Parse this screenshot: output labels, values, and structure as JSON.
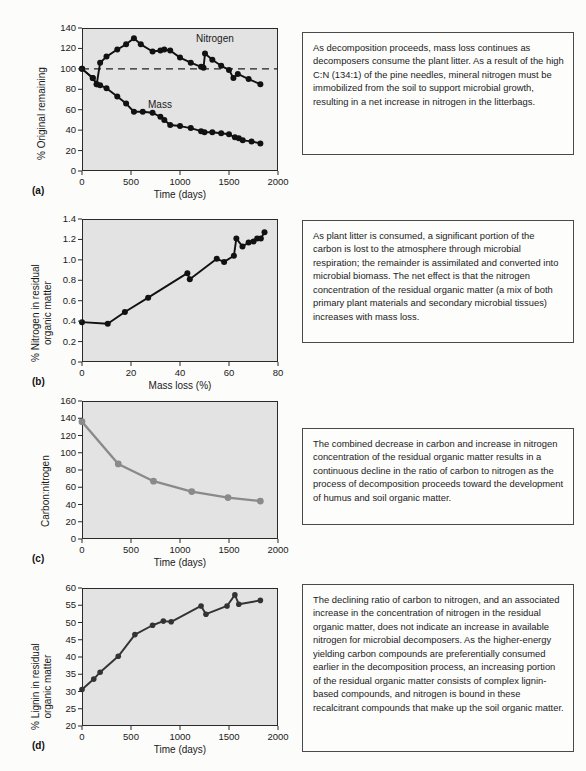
{
  "figure": {
    "panels": [
      "(a)",
      "(b)",
      "(c)",
      "(d)"
    ]
  },
  "panel_a": {
    "letter": "(a)",
    "xlabel": "Time (days)",
    "ylabel": "% Original remaining",
    "series_labels": {
      "nitrogen": "Nitrogen",
      "mass": "Mass"
    },
    "xticks": [
      "0",
      "500",
      "1000",
      "1500",
      "2000"
    ],
    "yticks": [
      "0",
      "20",
      "40",
      "60",
      "80",
      "100",
      "120",
      "140"
    ],
    "text": "As decomposition proceeds, mass loss continues as decomposers consume the plant litter. As a result of the high C:N (134:1) of the pine needles, mineral nitrogen must be immobilized from the soil to support microbial growth, resulting in a net increase in nitrogen in the litterbags."
  },
  "panel_b": {
    "letter": "(b)",
    "xlabel": "Mass loss (%)",
    "ylabel": "% Nitrogen in residual\norganic matter",
    "xticks": [
      "0",
      "20",
      "40",
      "60",
      "80"
    ],
    "yticks": [
      "0",
      "0.2",
      "0.4",
      "0.6",
      "0.8",
      "1.0",
      "1.2",
      "1.4"
    ],
    "text": "As plant litter is consumed, a significant portion of the carbon is lost to the atmosphere through microbial respiration; the remainder is assimilated and converted into microbial biomass. The net effect is that the nitrogen concentration of the residual organic matter (a mix of both primary plant materials and secondary microbial tissues) increases with mass loss."
  },
  "panel_c": {
    "letter": "(c)",
    "xlabel": "Time (days)",
    "ylabel": "Carbon:nitrogen",
    "xticks": [
      "0",
      "500",
      "1000",
      "1500",
      "2000"
    ],
    "yticks": [
      "0",
      "20",
      "40",
      "60",
      "80",
      "100",
      "120",
      "140",
      "160"
    ],
    "text": "The combined decrease in carbon and increase in nitrogen concentration of the residual organic matter results in a continuous decline in the ratio of carbon to nitrogen as the process of decomposition proceeds toward the development of humus and soil organic matter."
  },
  "panel_d": {
    "letter": "(d)",
    "xlabel": "Time (days)",
    "ylabel": "% Lignin in residual\norganic matter",
    "xticks": [
      "0",
      "500",
      "1000",
      "1500",
      "2000"
    ],
    "yticks": [
      "20",
      "25",
      "30",
      "35",
      "40",
      "45",
      "50",
      "55",
      "60"
    ],
    "text": "The declining ratio of carbon to nitrogen, and an associated increase in the concentration of nitrogen in the residual organic matter, does not indicate an increase in available nitrogen for microbial decomposers. As the higher-energy yielding carbon compounds are preferentially consumed earlier in the decomposition process, an increasing portion of the residual organic matter consists of complex lignin-based compounds, and nitrogen is bound in these recalcitrant compounds that make up the soil organic matter."
  },
  "colors": {
    "plot_background": "#e3e3e3",
    "axis": "#2a2a2a",
    "series_dark": "#111111",
    "series_gray": "#8a8a8a",
    "textbox_border": "#4a4a4a",
    "page_background": "#fcfcfa"
  },
  "chart_data": [
    {
      "id": "a",
      "type": "line",
      "title": "",
      "xlabel": "Time (days)",
      "ylabel": "% Original remaining",
      "xlim": [
        0,
        2000
      ],
      "ylim": [
        0,
        140
      ],
      "xticks": [
        0,
        500,
        1000,
        1500,
        2000
      ],
      "yticks": [
        0,
        20,
        40,
        60,
        80,
        100,
        120,
        140
      ],
      "grid": false,
      "legend": "inline-labels",
      "reference_line": {
        "y": 100,
        "style": "dashed",
        "label": "100% original"
      },
      "series": [
        {
          "name": "Nitrogen",
          "color": "#111111",
          "points": [
            [
              0,
              100
            ],
            [
              110,
              91
            ],
            [
              150,
              85
            ],
            [
              185,
              106
            ],
            [
              250,
              112
            ],
            [
              360,
              119
            ],
            [
              450,
              124
            ],
            [
              530,
              130
            ],
            [
              600,
              124
            ],
            [
              720,
              117
            ],
            [
              800,
              118
            ],
            [
              840,
              119
            ],
            [
              900,
              118
            ],
            [
              1000,
              111
            ],
            [
              1110,
              106
            ],
            [
              1215,
              102
            ],
            [
              1240,
              101
            ],
            [
              1255,
              115
            ],
            [
              1330,
              109
            ],
            [
              1420,
              103
            ],
            [
              1500,
              99
            ],
            [
              1545,
              91
            ],
            [
              1590,
              95
            ],
            [
              1700,
              90
            ],
            [
              1820,
              85
            ]
          ]
        },
        {
          "name": "Mass",
          "color": "#111111",
          "points": [
            [
              0,
              100
            ],
            [
              110,
              91
            ],
            [
              150,
              85
            ],
            [
              185,
              84
            ],
            [
              250,
              81
            ],
            [
              360,
              73
            ],
            [
              450,
              66
            ],
            [
              530,
              58
            ],
            [
              620,
              58
            ],
            [
              720,
              57
            ],
            [
              800,
              53
            ],
            [
              840,
              50
            ],
            [
              900,
              45
            ],
            [
              1000,
              44
            ],
            [
              1110,
              42
            ],
            [
              1215,
              39
            ],
            [
              1250,
              38
            ],
            [
              1330,
              38
            ],
            [
              1420,
              37
            ],
            [
              1500,
              36
            ],
            [
              1560,
              33
            ],
            [
              1600,
              32
            ],
            [
              1640,
              30
            ],
            [
              1730,
              29
            ],
            [
              1820,
              27
            ]
          ]
        }
      ]
    },
    {
      "id": "b",
      "type": "line",
      "title": "",
      "xlabel": "Mass loss (%)",
      "ylabel": "% Nitrogen in residual organic matter",
      "xlim": [
        0,
        80
      ],
      "ylim": [
        0,
        1.4
      ],
      "xticks": [
        0,
        20,
        40,
        60,
        80
      ],
      "yticks": [
        0,
        0.2,
        0.4,
        0.6,
        0.8,
        1.0,
        1.2,
        1.4
      ],
      "grid": false,
      "series": [
        {
          "name": "Nitrogen in residual organic matter",
          "color": "#111111",
          "points": [
            [
              0,
              0.39
            ],
            [
              10.5,
              0.375
            ],
            [
              17.5,
              0.49
            ],
            [
              27,
              0.63
            ],
            [
              43,
              0.87
            ],
            [
              44,
              0.81
            ],
            [
              55,
              1.01
            ],
            [
              58,
              0.98
            ],
            [
              62,
              1.04
            ],
            [
              63,
              1.21
            ],
            [
              65.5,
              1.13
            ],
            [
              68,
              1.17
            ],
            [
              70,
              1.18
            ],
            [
              71.5,
              1.21
            ],
            [
              73,
              1.21
            ],
            [
              74.5,
              1.27
            ]
          ]
        }
      ]
    },
    {
      "id": "c",
      "type": "line",
      "title": "",
      "xlabel": "Time (days)",
      "ylabel": "Carbon:nitrogen",
      "xlim": [
        0,
        2000
      ],
      "ylim": [
        0,
        160
      ],
      "xticks": [
        0,
        500,
        1000,
        1500,
        2000
      ],
      "yticks": [
        0,
        20,
        40,
        60,
        80,
        100,
        120,
        140,
        160
      ],
      "grid": false,
      "series": [
        {
          "name": "Carbon:nitrogen ratio",
          "color": "#8a8a8a",
          "points": [
            [
              0,
              136
            ],
            [
              370,
              87
            ],
            [
              730,
              67
            ],
            [
              1120,
              55
            ],
            [
              1490,
              48
            ],
            [
              1820,
              44
            ]
          ]
        }
      ]
    },
    {
      "id": "d",
      "type": "line",
      "title": "",
      "xlabel": "Time (days)",
      "ylabel": "% Lignin in residual organic matter",
      "xlim": [
        0,
        2000
      ],
      "ylim": [
        20,
        60
      ],
      "xticks": [
        0,
        500,
        1000,
        1500,
        2000
      ],
      "yticks": [
        20,
        25,
        30,
        35,
        40,
        45,
        50,
        55,
        60
      ],
      "grid": false,
      "series": [
        {
          "name": "Lignin in residual organic matter",
          "color": "#333333",
          "points": [
            [
              0,
              30.6
            ],
            [
              120,
              33.6
            ],
            [
              185,
              35.6
            ],
            [
              370,
              40.2
            ],
            [
              540,
              46.5
            ],
            [
              720,
              49.2
            ],
            [
              830,
              50.4
            ],
            [
              910,
              50.2
            ],
            [
              1215,
              54.8
            ],
            [
              1265,
              52.4
            ],
            [
              1480,
              54.8
            ],
            [
              1560,
              58.0
            ],
            [
              1600,
              55.3
            ],
            [
              1820,
              56.4
            ]
          ]
        }
      ]
    }
  ]
}
